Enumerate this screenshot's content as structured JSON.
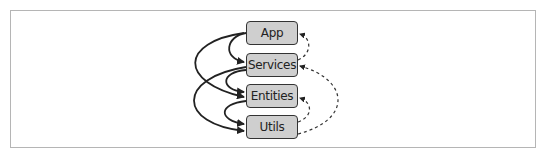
{
  "diagram": {
    "nodes": [
      {
        "id": "app",
        "label": "App"
      },
      {
        "id": "services",
        "label": "Services"
      },
      {
        "id": "entities",
        "label": "Entities"
      },
      {
        "id": "utils",
        "label": "Utils"
      }
    ],
    "edges_solid": [
      {
        "from": "App",
        "to": "Services"
      },
      {
        "from": "App",
        "to": "Entities"
      },
      {
        "from": "Services",
        "to": "Entities"
      },
      {
        "from": "Services",
        "to": "Utils"
      },
      {
        "from": "Entities",
        "to": "Utils"
      }
    ],
    "edges_dashed": [
      {
        "from": "Services",
        "to": "App"
      },
      {
        "from": "Entities",
        "to": "Services"
      },
      {
        "from": "Utils",
        "to": "Entities"
      },
      {
        "from": "Utils",
        "to": "Services"
      }
    ],
    "colors": {
      "node_fill": "#cfcfcf",
      "node_border": "#333333",
      "edge": "#222222",
      "frame": "#b5b5b5"
    }
  }
}
